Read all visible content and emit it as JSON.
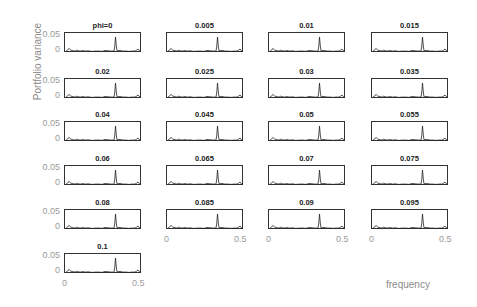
{
  "chart_data": {
    "type": "line",
    "title": "",
    "xlabel": "frequency",
    "ylabel": "Portfolio variance",
    "xlim": [
      0,
      0.5
    ],
    "ylim": [
      0,
      0.06
    ],
    "xticks": [
      "0",
      "0.5"
    ],
    "yticks": [
      "0",
      "0.05"
    ],
    "grid": false,
    "layout": {
      "rows": 6,
      "cols": 4,
      "panels": 21
    },
    "panel_titles": [
      "phi=0",
      "0.005",
      "0.01",
      "0.015",
      "0.02",
      "0.025",
      "0.03",
      "0.035",
      "0.04",
      "0.045",
      "0.05",
      "0.055",
      "0.06",
      "0.065",
      "0.07",
      "0.075",
      "0.08",
      "0.085",
      "0.09",
      "0.095",
      "0.1"
    ],
    "series_shape": {
      "description": "spectral density per panel: small peak near f=0.02, low noisy baseline, sharp dominant peak near f=0.33 reaching ~0.05, small bump near f=0.48",
      "x": [
        0,
        0.01,
        0.02,
        0.025,
        0.03,
        0.04,
        0.06,
        0.07,
        0.08,
        0.1,
        0.11,
        0.13,
        0.15,
        0.17,
        0.2,
        0.22,
        0.24,
        0.26,
        0.28,
        0.3,
        0.32,
        0.325,
        0.33,
        0.335,
        0.34,
        0.36,
        0.38,
        0.4,
        0.42,
        0.44,
        0.46,
        0.47,
        0.48,
        0.49,
        0.5
      ],
      "y": [
        0.003,
        0.006,
        0.012,
        0.009,
        0.007,
        0.005,
        0.003,
        0.006,
        0.004,
        0.003,
        0.005,
        0.003,
        0.004,
        0.002,
        0.003,
        0.003,
        0.002,
        0.005,
        0.004,
        0.003,
        0.003,
        0.02,
        0.05,
        0.02,
        0.004,
        0.005,
        0.003,
        0.003,
        0.002,
        0.003,
        0.003,
        0.006,
        0.01,
        0.004,
        0.002
      ]
    }
  },
  "labels": {
    "ylabel": "Portfolio variance",
    "xlabel": "frequency",
    "ytick_top": "0.05",
    "ytick_bottom": "0",
    "xtick_left": "0",
    "xtick_right": "0.5"
  },
  "panels": [
    {
      "title": "phi=0",
      "x": 64,
      "y": 32
    },
    {
      "title": "0.005",
      "x": 166,
      "y": 32
    },
    {
      "title": "0.01",
      "x": 268,
      "y": 32
    },
    {
      "title": "0.015",
      "x": 371,
      "y": 32
    },
    {
      "title": "0.02",
      "x": 64,
      "y": 78
    },
    {
      "title": "0.025",
      "x": 166,
      "y": 78
    },
    {
      "title": "0.03",
      "x": 268,
      "y": 78
    },
    {
      "title": "0.035",
      "x": 371,
      "y": 78
    },
    {
      "title": "0.04",
      "x": 64,
      "y": 121
    },
    {
      "title": "0.045",
      "x": 166,
      "y": 121
    },
    {
      "title": "0.05",
      "x": 268,
      "y": 121
    },
    {
      "title": "0.055",
      "x": 371,
      "y": 121
    },
    {
      "title": "0.06",
      "x": 64,
      "y": 165
    },
    {
      "title": "0.065",
      "x": 166,
      "y": 165
    },
    {
      "title": "0.07",
      "x": 268,
      "y": 165
    },
    {
      "title": "0.075",
      "x": 371,
      "y": 165
    },
    {
      "title": "0.08",
      "x": 64,
      "y": 209
    },
    {
      "title": "0.085",
      "x": 166,
      "y": 209
    },
    {
      "title": "0.09",
      "x": 268,
      "y": 209
    },
    {
      "title": "0.095",
      "x": 371,
      "y": 209
    },
    {
      "title": "0.1",
      "x": 64,
      "y": 253
    }
  ]
}
